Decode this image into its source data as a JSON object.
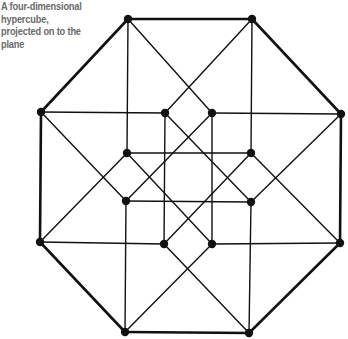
{
  "caption": {
    "lines": [
      "A four-dimensional",
      "hypercube,",
      "projected on to the",
      "plane"
    ]
  },
  "diagram": {
    "line_color": "#111111",
    "outer_vertices": [
      {
        "id": "A",
        "x": 128,
        "y": 19
      },
      {
        "id": "B",
        "x": 252,
        "y": 19
      },
      {
        "id": "C",
        "x": 341,
        "y": 114
      },
      {
        "id": "D",
        "x": 340,
        "y": 243
      },
      {
        "id": "E",
        "x": 249,
        "y": 333
      },
      {
        "id": "F",
        "x": 125,
        "y": 332
      },
      {
        "id": "G",
        "x": 40,
        "y": 242
      },
      {
        "id": "H",
        "x": 41,
        "y": 112
      }
    ],
    "inner_vertices": [
      {
        "id": "a",
        "x": 165,
        "y": 113
      },
      {
        "id": "b",
        "x": 212,
        "y": 113
      },
      {
        "id": "c",
        "x": 251,
        "y": 153
      },
      {
        "id": "d",
        "x": 251,
        "y": 202
      },
      {
        "id": "e",
        "x": 212,
        "y": 244
      },
      {
        "id": "f",
        "x": 164,
        "y": 244
      },
      {
        "id": "g",
        "x": 126,
        "y": 201
      },
      {
        "id": "h",
        "x": 127,
        "y": 153
      }
    ],
    "thick_edges": [
      [
        "A",
        "B"
      ],
      [
        "B",
        "C"
      ],
      [
        "C",
        "D"
      ],
      [
        "D",
        "E"
      ],
      [
        "E",
        "F"
      ],
      [
        "F",
        "G"
      ],
      [
        "G",
        "H"
      ],
      [
        "H",
        "A"
      ]
    ],
    "thin_edges": [
      [
        "A",
        "h"
      ],
      [
        "A",
        "b"
      ],
      [
        "B",
        "c"
      ],
      [
        "B",
        "a"
      ],
      [
        "C",
        "b"
      ],
      [
        "C",
        "d"
      ],
      [
        "D",
        "e"
      ],
      [
        "D",
        "c"
      ],
      [
        "E",
        "d"
      ],
      [
        "E",
        "f"
      ],
      [
        "F",
        "g"
      ],
      [
        "F",
        "e"
      ],
      [
        "G",
        "f"
      ],
      [
        "G",
        "h"
      ],
      [
        "H",
        "a"
      ],
      [
        "H",
        "g"
      ],
      [
        "a",
        "f"
      ],
      [
        "b",
        "e"
      ],
      [
        "h",
        "c"
      ],
      [
        "g",
        "d"
      ],
      [
        "a",
        "d"
      ],
      [
        "b",
        "g"
      ],
      [
        "h",
        "e"
      ],
      [
        "c",
        "f"
      ]
    ]
  }
}
